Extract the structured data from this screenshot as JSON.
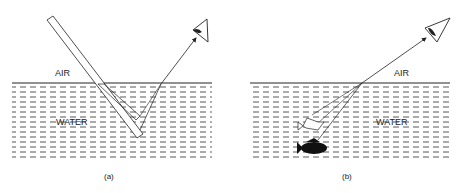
{
  "panels": [
    {
      "id": "a",
      "caption": "(a)",
      "air_label": "AIR",
      "water_label": "WATER",
      "description": "Stick partly submerged in water appears bent due to refraction"
    },
    {
      "id": "b",
      "caption": "(b)",
      "air_label": "AIR",
      "water_label": "WATER",
      "description": "Fish appears higher than actual position due to refraction"
    }
  ],
  "colors": {
    "ink": "#222222",
    "water_dash": "#555555",
    "background": "#ffffff"
  }
}
